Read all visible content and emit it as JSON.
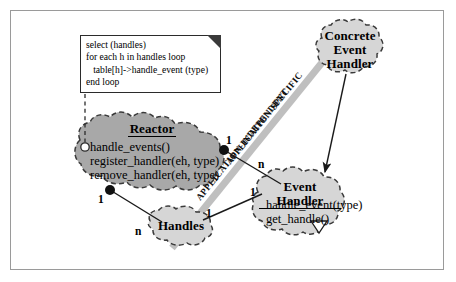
{
  "figure": {
    "background_color": "#ffffff",
    "frame_color": "#9a9a9a",
    "blob_fill_dark": "#a8a8a8",
    "blob_fill_light": "#d6d6d6",
    "divider_color": "#bdbdbd",
    "line_color": "#1a1a1a"
  },
  "note": {
    "name": "pseudocode-note",
    "lines": [
      "select (handles)",
      "for each h in handles loop",
      "   table[h]->handle_event (type)",
      "end loop"
    ],
    "fold_icon": "dog-ear-fold-icon"
  },
  "divider": {
    "upper_label": "APPLICATION-SPECIFIC",
    "lower_label": "APPLICATION-INDEPENDENT"
  },
  "classes": [
    {
      "id": "reactor",
      "name": "Reactor",
      "title_lines": [
        "Reactor"
      ],
      "operations": [
        "handle_events()",
        "register_handler(eh, type)",
        "remove_handler(eh, type)"
      ],
      "abstract": false,
      "fill": "dark"
    },
    {
      "id": "event-handler",
      "name": "Event Handler",
      "title_lines": [
        "Event Handler"
      ],
      "operations": [
        "handle_event(type)",
        "get_handle()"
      ],
      "abstract": true,
      "fill": "light"
    },
    {
      "id": "concrete-event-handler",
      "name": "Concrete Event Handler",
      "title_lines": [
        "Concrete",
        "Event",
        "Handler"
      ],
      "operations": [],
      "abstract": true,
      "fill": "light"
    },
    {
      "id": "handles",
      "name": "Handles",
      "title_lines": [
        "Handles"
      ],
      "operations": [],
      "abstract": false,
      "fill": "light"
    }
  ],
  "multiplicities": {
    "reactor_to_eventhandler_near": "1",
    "reactor_to_eventhandler_far": "n",
    "reactor_to_handles_near": "1",
    "reactor_to_handles_far": "n",
    "handles_to_eventhandler_near": "1",
    "handles_to_eventhandler_far": "1"
  },
  "connectors": [
    {
      "name": "reactor-owns-event-handlers",
      "kind": "aggregation",
      "from": "reactor",
      "to": "event-handler"
    },
    {
      "name": "reactor-owns-handles",
      "kind": "aggregation",
      "from": "reactor",
      "to": "handles"
    },
    {
      "name": "handles-to-event-handler",
      "kind": "association",
      "from": "handles",
      "to": "event-handler"
    },
    {
      "name": "concrete-inherits-event-handler",
      "kind": "generalization",
      "from": "concrete-event-handler",
      "to": "event-handler"
    },
    {
      "name": "note-anchor-to-reactor",
      "kind": "note-link",
      "from": "pseudocode-note",
      "to": "reactor"
    }
  ],
  "markers": {
    "abstract_triangle": "inverted-triangle-icon",
    "note_anchor": "hollow-circle-icon",
    "aggregation_dot": "filled-circle-icon"
  }
}
